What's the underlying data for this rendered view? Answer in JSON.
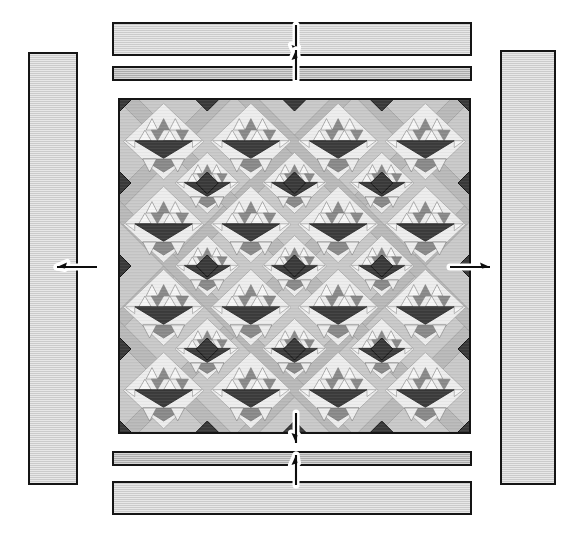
{
  "diagram": {
    "type": "quilt-construction-schematic",
    "canvas": {
      "width": 583,
      "height": 540
    }
  },
  "colors": {
    "background": "#ffffff",
    "outline": "#151515",
    "border_strip_light": "#d6d6d6",
    "border_strip_medium": "#b4b4b4",
    "quilt_field": "#c9c9c9",
    "lattice_strip": "#b9b9b9",
    "lattice_strip_shadow": "#a0a0a0",
    "setting_square_dark": "#3a3a3a",
    "basket_dark": "#3c3c3c",
    "basket_mid": "#8a8a8a",
    "basket_light": "#ededed",
    "basket_white": "#f7f7f7"
  },
  "center_panel": {
    "name": "pieced quilt center",
    "x": 118,
    "y": 98,
    "width": 353,
    "height": 336,
    "blocks_across": 4,
    "blocks_down": 4,
    "block_motif": "basket of triangles set on point",
    "lattice": "diagonal sashing grid with dark setting squares"
  },
  "border_strips": [
    {
      "id": "top-outer",
      "label": "top outer border strip",
      "tone": "light",
      "x": 112,
      "y": 22,
      "width": 360,
      "height": 34
    },
    {
      "id": "top-inner",
      "label": "top inner border strip",
      "tone": "medium",
      "x": 112,
      "y": 66,
      "width": 360,
      "height": 15
    },
    {
      "id": "bottom-inner",
      "label": "bottom inner border strip",
      "tone": "medium",
      "x": 112,
      "y": 451,
      "width": 360,
      "height": 15
    },
    {
      "id": "bottom-outer",
      "label": "bottom outer border strip",
      "tone": "light",
      "x": 112,
      "y": 481,
      "width": 360,
      "height": 34
    },
    {
      "id": "left-outer",
      "label": "left outer border strip",
      "tone": "light",
      "x": 28,
      "y": 52,
      "width": 50,
      "height": 433
    },
    {
      "id": "right-outer",
      "label": "right outer border strip",
      "tone": "light",
      "x": 500,
      "y": 50,
      "width": 56,
      "height": 435
    }
  ],
  "arrows": [
    {
      "id": "top-down",
      "label": "attach top outer border",
      "direction": "down",
      "x": 296,
      "y": 40,
      "length": 30
    },
    {
      "id": "top-up",
      "label": "attach top inner border",
      "direction": "up",
      "x": 296,
      "y": 65,
      "length": 30
    },
    {
      "id": "bottom-down",
      "label": "attach bottom inner border",
      "direction": "down",
      "x": 296,
      "y": 428,
      "length": 30
    },
    {
      "id": "bottom-up",
      "label": "attach bottom outer border",
      "direction": "up",
      "x": 296,
      "y": 470,
      "length": 30
    },
    {
      "id": "left-out",
      "label": "attach left outer border",
      "direction": "left",
      "x": 77,
      "y": 267,
      "length": 40
    },
    {
      "id": "right-out",
      "label": "attach right outer border",
      "direction": "right",
      "x": 470,
      "y": 267,
      "length": 40
    }
  ]
}
